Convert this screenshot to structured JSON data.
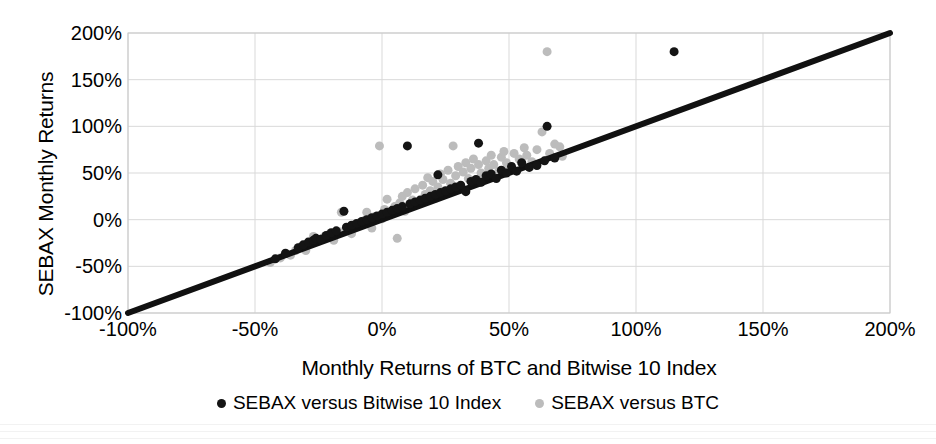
{
  "chart_data": {
    "type": "scatter",
    "title": "",
    "xlabel": "Monthly Returns of BTC and Bitwise 10 Index",
    "ylabel": "SEBAX Monthly Returns",
    "xlim": [
      -100,
      200
    ],
    "ylim": [
      -100,
      200
    ],
    "xticks": [
      "-100%",
      "-50%",
      "0%",
      "50%",
      "100%",
      "150%",
      "200%"
    ],
    "xtick_values": [
      -100,
      -50,
      0,
      50,
      100,
      150,
      200
    ],
    "yticks": [
      "-100%",
      "-50%",
      "0%",
      "50%",
      "100%",
      "150%",
      "200%"
    ],
    "ytick_values": [
      -100,
      -50,
      0,
      50,
      100,
      150,
      200
    ],
    "grid": true,
    "grid_color": "#d9d9d9",
    "legend_position": "bottom",
    "reference_line": {
      "name": "y = x identity line",
      "color": "#111111",
      "width": 6,
      "from": [
        -100,
        -100
      ],
      "to": [
        200,
        200
      ]
    },
    "series": [
      {
        "name": "SEBAX versus Bitwise 10 Index",
        "color": "#141414",
        "marker": "circle",
        "marker_size": 9,
        "points": [
          [
            -42,
            -42
          ],
          [
            -38,
            -36
          ],
          [
            -33,
            -30
          ],
          [
            -31,
            -27
          ],
          [
            -29,
            -24
          ],
          [
            -27,
            -22
          ],
          [
            -26,
            -20
          ],
          [
            -24,
            -21
          ],
          [
            -22,
            -17
          ],
          [
            -20,
            -14
          ],
          [
            -18,
            -12
          ],
          [
            -15,
            9
          ],
          [
            -14,
            -8
          ],
          [
            -12,
            -6
          ],
          [
            -10,
            -4
          ],
          [
            -8,
            -2
          ],
          [
            -6,
            0
          ],
          [
            -4,
            2
          ],
          [
            -2,
            4
          ],
          [
            0,
            6
          ],
          [
            2,
            8
          ],
          [
            4,
            10
          ],
          [
            6,
            12
          ],
          [
            8,
            14
          ],
          [
            10,
            79
          ],
          [
            11,
            17
          ],
          [
            13,
            19
          ],
          [
            15,
            21
          ],
          [
            17,
            23
          ],
          [
            19,
            25
          ],
          [
            21,
            27
          ],
          [
            22,
            48
          ],
          [
            23,
            29
          ],
          [
            25,
            31
          ],
          [
            27,
            33
          ],
          [
            29,
            35
          ],
          [
            31,
            37
          ],
          [
            33,
            30
          ],
          [
            35,
            41
          ],
          [
            37,
            43
          ],
          [
            38,
            82
          ],
          [
            39,
            40
          ],
          [
            41,
            47
          ],
          [
            43,
            49
          ],
          [
            45,
            44
          ],
          [
            47,
            53
          ],
          [
            49,
            50
          ],
          [
            51,
            57
          ],
          [
            53,
            52
          ],
          [
            55,
            61
          ],
          [
            58,
            56
          ],
          [
            61,
            58
          ],
          [
            64,
            63
          ],
          [
            65,
            100
          ],
          [
            68,
            66
          ],
          [
            115,
            180
          ]
        ]
      },
      {
        "name": "SEBAX versus BTC",
        "color": "#bcbcbc",
        "marker": "circle",
        "marker_size": 9,
        "points": [
          [
            -44,
            -46
          ],
          [
            -40,
            -41
          ],
          [
            -36,
            -38
          ],
          [
            -34,
            -33
          ],
          [
            -32,
            -29
          ],
          [
            -30,
            -33
          ],
          [
            -28,
            -25
          ],
          [
            -27,
            -18
          ],
          [
            -25,
            -23
          ],
          [
            -23,
            -19
          ],
          [
            -21,
            -16
          ],
          [
            -19,
            -22
          ],
          [
            -17,
            -13
          ],
          [
            -16,
            8
          ],
          [
            -14,
            -10
          ],
          [
            -12,
            -15
          ],
          [
            -11,
            -7
          ],
          [
            -9,
            -5
          ],
          [
            -7,
            -1
          ],
          [
            -6,
            8
          ],
          [
            -4,
            -9
          ],
          [
            -3,
            3
          ],
          [
            -1,
            79
          ],
          [
            0,
            1
          ],
          [
            1,
            11
          ],
          [
            2,
            22
          ],
          [
            3,
            7
          ],
          [
            5,
            14
          ],
          [
            6,
            -20
          ],
          [
            7,
            18
          ],
          [
            8,
            25
          ],
          [
            9,
            9
          ],
          [
            10,
            29
          ],
          [
            12,
            21
          ],
          [
            13,
            33
          ],
          [
            14,
            17
          ],
          [
            16,
            37
          ],
          [
            17,
            27
          ],
          [
            18,
            45
          ],
          [
            19,
            31
          ],
          [
            20,
            41
          ],
          [
            21,
            23
          ],
          [
            22,
            35
          ],
          [
            23,
            49
          ],
          [
            24,
            43
          ],
          [
            25,
            30
          ],
          [
            26,
            53
          ],
          [
            27,
            39
          ],
          [
            28,
            79
          ],
          [
            29,
            47
          ],
          [
            30,
            57
          ],
          [
            31,
            36
          ],
          [
            32,
            51
          ],
          [
            33,
            61
          ],
          [
            34,
            44
          ],
          [
            35,
            55
          ],
          [
            36,
            65
          ],
          [
            37,
            41
          ],
          [
            38,
            59
          ],
          [
            39,
            50
          ],
          [
            40,
            46
          ],
          [
            41,
            63
          ],
          [
            42,
            55
          ],
          [
            43,
            69
          ],
          [
            44,
            59
          ],
          [
            46,
            52
          ],
          [
            47,
            67
          ],
          [
            48,
            73
          ],
          [
            49,
            61
          ],
          [
            50,
            57
          ],
          [
            52,
            71
          ],
          [
            54,
            65
          ],
          [
            56,
            77
          ],
          [
            57,
            69
          ],
          [
            59,
            62
          ],
          [
            61,
            75
          ],
          [
            63,
            94
          ],
          [
            65,
            180
          ],
          [
            66,
            71
          ],
          [
            68,
            81
          ],
          [
            70,
            78
          ],
          [
            71,
            68
          ]
        ]
      }
    ]
  },
  "legend": {
    "items": [
      {
        "label": "SEBAX versus Bitwise 10 Index",
        "color": "#141414"
      },
      {
        "label": "SEBAX versus BTC",
        "color": "#bcbcbc"
      }
    ]
  }
}
